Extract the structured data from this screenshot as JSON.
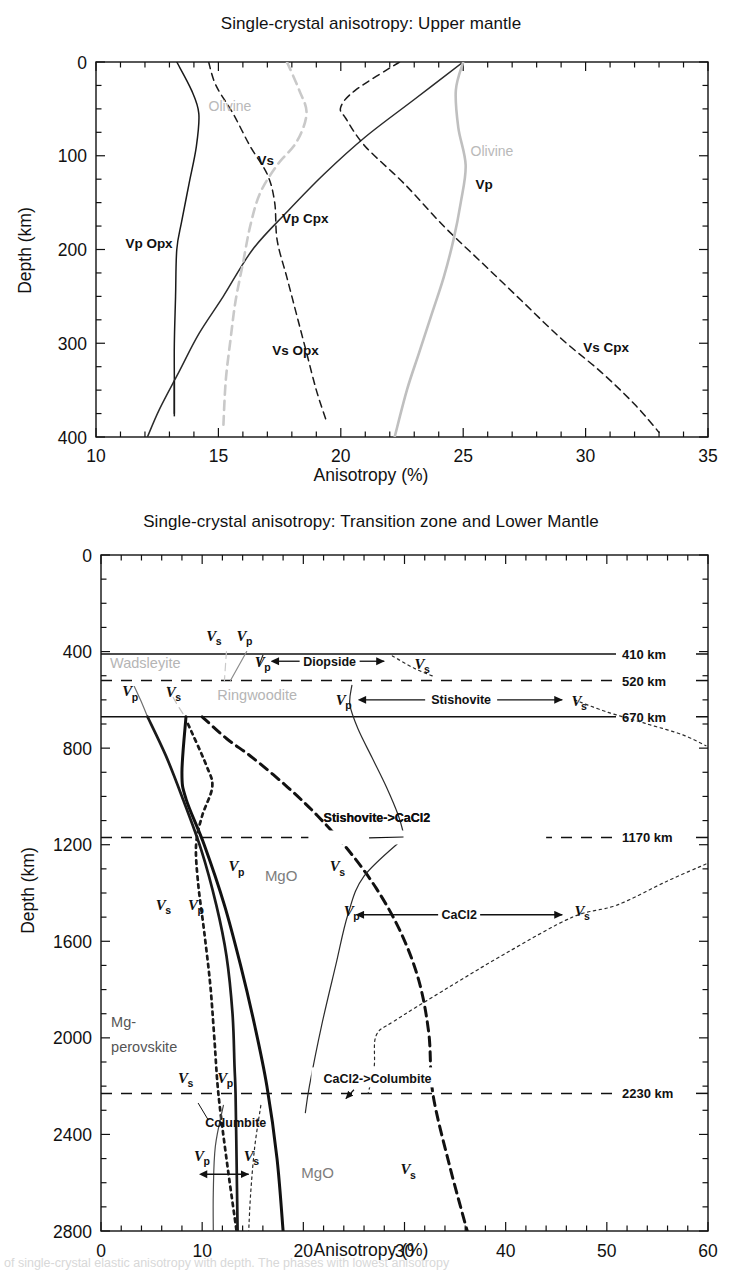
{
  "figure": {
    "caption_fragment": "of single-crystal elastic anisotropy with depth. The phases with lowest anisotropy"
  },
  "panels": [
    {
      "id": "upper-mantle",
      "title": "Single-crystal anisotropy: Upper mantle",
      "xlabel": "Anisotropy  (%)",
      "ylabel": "Depth (km)",
      "xticks": [
        "10",
        "15",
        "20",
        "25",
        "30",
        "35"
      ],
      "yticks": [
        "0",
        "100",
        "200",
        "300",
        "400"
      ],
      "labels": {
        "olivine_vs": "Olivine",
        "olivine_vp": "Olivine",
        "vs": "Vs",
        "vp": "Vp",
        "vp_opx": "Vp Opx",
        "vs_opx": "Vs Opx",
        "vp_cpx": "Vp Cpx",
        "vs_cpx": "Vs Cpx"
      }
    },
    {
      "id": "transition-lower-mantle",
      "title": "Single-crystal anisotropy: Transition zone and Lower Mantle",
      "xlabel": "Anisotropy (%)",
      "ylabel": "Depth (km)",
      "xticks": [
        "0",
        "10",
        "20",
        "30",
        "40",
        "50",
        "60"
      ],
      "yticks": [
        "0",
        "400",
        "800",
        "1200",
        "1600",
        "2000",
        "2400",
        "2800"
      ],
      "boundaries": [
        {
          "label": "410 km",
          "depth": 410,
          "style": "solid"
        },
        {
          "label": "520 km",
          "depth": 520,
          "style": "dashed"
        },
        {
          "label": "670 km",
          "depth": 670,
          "style": "solid"
        },
        {
          "label": "1170 km",
          "depth": 1170,
          "style": "dashed"
        },
        {
          "label": "2230 km",
          "depth": 2230,
          "style": "dashed"
        }
      ],
      "phase_labels": {
        "wadsleyite": "Wadsleyite",
        "ringwoodite": "Ringwoodite",
        "mg_perovskite_line1": "Mg-",
        "mg_perovskite_line2": "perovskite",
        "columbite": "Columbite",
        "mgo_1": "MgO",
        "mgo_2": "MgO"
      },
      "annotations": [
        {
          "label": "Diopside",
          "depth": 440
        },
        {
          "label": "Stishovite",
          "depth": 600
        },
        {
          "label": "Stishovite->CaCl2",
          "depth": 1120
        },
        {
          "label": "CaCl2",
          "depth": 1490
        },
        {
          "label": "CaCl2->Columbite",
          "depth": 2180
        }
      ],
      "velocity_symbols": {
        "vp": "V",
        "vp_sub": "p",
        "vs": "V",
        "vs_sub": "s"
      }
    }
  ],
  "chart_data": [
    {
      "type": "line",
      "id": "upper-mantle",
      "title": "Single-crystal anisotropy: Upper mantle",
      "xlabel": "Anisotropy  (%)",
      "ylabel": "Depth (km)",
      "xlim": [
        10,
        35
      ],
      "ylim": [
        0,
        400
      ],
      "y_inverted": true,
      "grid": false,
      "legend": "inline-curve-labels",
      "xticks": [
        10,
        15,
        20,
        25,
        30,
        35
      ],
      "yticks": [
        0,
        100,
        200,
        300,
        400
      ],
      "series": [
        {
          "name": "Vp Opx",
          "style": "solid",
          "color": "#1a1a1a",
          "points": [
            [
              13.3,
              0
            ],
            [
              13.9,
              30
            ],
            [
              14.2,
              55
            ],
            [
              14.1,
              90
            ],
            [
              13.8,
              130
            ],
            [
              13.5,
              170
            ],
            [
              13.3,
              200
            ],
            [
              13.25,
              250
            ],
            [
              13.2,
              300
            ],
            [
              13.2,
              340
            ],
            [
              13.2,
              375
            ]
          ]
        },
        {
          "name": "Vs Opx",
          "style": "dashed",
          "color": "#1a1a1a",
          "points": [
            [
              14.6,
              0
            ],
            [
              14.9,
              25
            ],
            [
              15.6,
              55
            ],
            [
              16.3,
              90
            ],
            [
              17.0,
              120
            ],
            [
              17.3,
              150
            ],
            [
              17.4,
              190
            ],
            [
              17.8,
              230
            ],
            [
              18.2,
              270
            ],
            [
              18.6,
              310
            ],
            [
              19.0,
              350
            ],
            [
              19.4,
              382
            ]
          ]
        },
        {
          "name": "Vp Cpx",
          "style": "solid",
          "color": "#2b2b2b",
          "points": [
            [
              25.0,
              0
            ],
            [
              23.0,
              40
            ],
            [
              21.0,
              80
            ],
            [
              19.3,
              120
            ],
            [
              17.8,
              160
            ],
            [
              16.4,
              200
            ],
            [
              15.2,
              250
            ],
            [
              14.2,
              290
            ],
            [
              13.4,
              330
            ],
            [
              12.6,
              370
            ],
            [
              12.1,
              400
            ]
          ]
        },
        {
          "name": "Vs Cpx",
          "style": "dashed",
          "color": "#1a1a1a",
          "points": [
            [
              22.4,
              0
            ],
            [
              20.6,
              30
            ],
            [
              20.0,
              48
            ],
            [
              20.2,
              60
            ],
            [
              21.0,
              90
            ],
            [
              22.6,
              130
            ],
            [
              24.2,
              175
            ],
            [
              25.8,
              215
            ],
            [
              27.4,
              255
            ],
            [
              29.0,
              295
            ],
            [
              30.6,
              330
            ],
            [
              32.0,
              365
            ],
            [
              33.0,
              395
            ]
          ]
        },
        {
          "name": "Olivine Vp",
          "style": "solid",
          "color": "#bfbfbf",
          "points": [
            [
              25.0,
              0
            ],
            [
              24.7,
              30
            ],
            [
              24.8,
              70
            ],
            [
              25.1,
              110
            ],
            [
              24.9,
              150
            ],
            [
              24.6,
              190
            ],
            [
              24.2,
              230
            ],
            [
              23.7,
              270
            ],
            [
              23.2,
              310
            ],
            [
              22.7,
              350
            ],
            [
              22.2,
              400
            ]
          ]
        },
        {
          "name": "Olivine Vs",
          "style": "dashed",
          "color": "#c9c9c9",
          "points": [
            [
              17.8,
              0
            ],
            [
              18.3,
              30
            ],
            [
              18.6,
              55
            ],
            [
              18.2,
              85
            ],
            [
              17.4,
              110
            ],
            [
              16.7,
              140
            ],
            [
              16.3,
              175
            ],
            [
              16.0,
              215
            ],
            [
              15.7,
              255
            ],
            [
              15.5,
              295
            ],
            [
              15.3,
              340
            ],
            [
              15.2,
              390
            ]
          ]
        }
      ]
    },
    {
      "type": "line",
      "id": "transition-lower-mantle",
      "title": "Single-crystal anisotropy: Transition zone and Lower Mantle",
      "xlabel": "Anisotropy (%)",
      "ylabel": "Depth (km)",
      "xlim": [
        0,
        60
      ],
      "ylim": [
        0,
        2800
      ],
      "y_inverted": true,
      "grid": false,
      "legend": "inline-curve-labels",
      "xticks": [
        0,
        10,
        20,
        30,
        40,
        50,
        60
      ],
      "yticks": [
        0,
        400,
        800,
        1200,
        1600,
        2000,
        2400,
        2800
      ],
      "series": [
        {
          "name": "Wadsleyite Vs",
          "style": "dashed",
          "color": "#c9c9c9",
          "points": [
            [
              12.4,
              400
            ],
            [
              12.2,
              520
            ]
          ]
        },
        {
          "name": "Wadsleyite Vp",
          "style": "solid",
          "color": "#8c8c8c",
          "points": [
            [
              14.4,
              400
            ],
            [
              12.8,
              520
            ]
          ]
        },
        {
          "name": "Diopside Vp",
          "style": "solid",
          "color": "#2b2b2b",
          "points": [
            [
              16.0,
              415
            ],
            [
              15.6,
              460
            ]
          ]
        },
        {
          "name": "Diopside Vs",
          "style": "dotted",
          "color": "#2b2b2b",
          "points": [
            [
              28.8,
              418
            ],
            [
              31.0,
              470
            ],
            [
              33.0,
              505
            ]
          ]
        },
        {
          "name": "Ringwoodite Vp",
          "style": "solid",
          "color": "#6f6f6f",
          "points": [
            [
              3.3,
              545
            ],
            [
              3.9,
              600
            ],
            [
              4.6,
              670
            ]
          ]
        },
        {
          "name": "Ringwoodite Vs",
          "style": "dashed",
          "color": "#c2c2c2",
          "points": [
            [
              6.6,
              545
            ],
            [
              7.4,
              610
            ],
            [
              8.3,
              670
            ]
          ]
        },
        {
          "name": "Stishovite Vp",
          "style": "solid",
          "color": "#2b2b2b",
          "points": [
            [
              24.8,
              540
            ],
            [
              24.6,
              620
            ],
            [
              25.4,
              720
            ],
            [
              26.8,
              840
            ],
            [
              28.2,
              960
            ],
            [
              29.4,
              1080
            ],
            [
              30.0,
              1170
            ]
          ]
        },
        {
          "name": "Stishovite Vs",
          "style": "dotted",
          "color": "#2b2b2b",
          "points": [
            [
              46.8,
              600
            ],
            [
              50.0,
              650
            ],
            [
              54.0,
              700
            ],
            [
              57.5,
              745
            ],
            [
              59.8,
              790
            ]
          ]
        },
        {
          "name": "Mg-perovskite Vp",
          "style": "solid",
          "color": "#1a1a1a",
          "points": [
            [
              4.6,
              670
            ],
            [
              6.4,
              830
            ],
            [
              8.0,
              1000
            ],
            [
              9.9,
              1220
            ],
            [
              11.4,
              1450
            ],
            [
              12.4,
              1660
            ],
            [
              13.0,
              1900
            ],
            [
              13.2,
              2120
            ],
            [
              13.3,
              2230
            ],
            [
              13.4,
              2500
            ],
            [
              13.5,
              2800
            ]
          ]
        },
        {
          "name": "MgO Vp",
          "style": "solid",
          "color": "#111111",
          "points": [
            [
              8.4,
              670
            ],
            [
              8.0,
              900
            ],
            [
              8.4,
              1010
            ],
            [
              10.2,
              1200
            ],
            [
              12.2,
              1450
            ],
            [
              13.8,
              1700
            ],
            [
              15.2,
              1950
            ],
            [
              16.4,
              2200
            ],
            [
              17.4,
              2500
            ],
            [
              18.0,
              2800
            ]
          ]
        },
        {
          "name": "Mg-perovskite Vs",
          "style": "dotted",
          "color": "#1a1a1a",
          "points": [
            [
              8.6,
              700
            ],
            [
              10.4,
              870
            ],
            [
              11.0,
              960
            ],
            [
              10.0,
              1080
            ],
            [
              9.4,
              1200
            ],
            [
              9.6,
              1360
            ],
            [
              10.2,
              1560
            ],
            [
              10.8,
              1780
            ],
            [
              11.2,
              2000
            ],
            [
              11.6,
              2230
            ],
            [
              12.4,
              2500
            ],
            [
              13.4,
              2800
            ]
          ]
        },
        {
          "name": "MgO Vs",
          "style": "dashed",
          "color": "#111111",
          "points": [
            [
              10.0,
              670
            ],
            [
              12.4,
              760
            ],
            [
              15.0,
              840
            ],
            [
              18.4,
              960
            ],
            [
              21.4,
              1080
            ],
            [
              24.4,
              1220
            ],
            [
              27.2,
              1380
            ],
            [
              29.6,
              1560
            ],
            [
              31.4,
              1760
            ],
            [
              32.4,
              1980
            ],
            [
              32.8,
              2230
            ],
            [
              34.4,
              2520
            ],
            [
              36.2,
              2800
            ]
          ]
        },
        {
          "name": "CaCl2 Vp",
          "style": "solid",
          "color": "#2b2b2b",
          "points": [
            [
              30.0,
              1170
            ],
            [
              26.0,
              1330
            ],
            [
              24.4,
              1490
            ],
            [
              23.2,
              1700
            ],
            [
              21.8,
              1950
            ],
            [
              20.6,
              2200
            ],
            [
              20.2,
              2310
            ]
          ]
        },
        {
          "name": "CaCl2 Vs",
          "style": "dotted",
          "color": "#2b2b2b",
          "points": [
            [
              59.8,
              1280
            ],
            [
              56.0,
              1350
            ],
            [
              51.0,
              1450
            ],
            [
              46.6,
              1500
            ],
            [
              40.0,
              1650
            ],
            [
              34.0,
              1800
            ],
            [
              29.0,
              1930
            ],
            [
              27.2,
              1990
            ],
            [
              27.0,
              2120
            ],
            [
              26.4,
              2230
            ]
          ]
        },
        {
          "name": "Columbite Vp",
          "style": "solid",
          "color": "#4a4a4a",
          "points": [
            [
              12.1,
              2280
            ],
            [
              11.3,
              2450
            ],
            [
              11.1,
              2640
            ],
            [
              11.1,
              2800
            ]
          ]
        },
        {
          "name": "Columbite Vs",
          "style": "dotted",
          "color": "#2b2b2b",
          "points": [
            [
              15.8,
              2280
            ],
            [
              15.2,
              2450
            ],
            [
              14.8,
              2640
            ],
            [
              14.6,
              2800
            ]
          ]
        }
      ],
      "boundary_lines": [
        410,
        520,
        670,
        1170,
        2230
      ]
    }
  ]
}
